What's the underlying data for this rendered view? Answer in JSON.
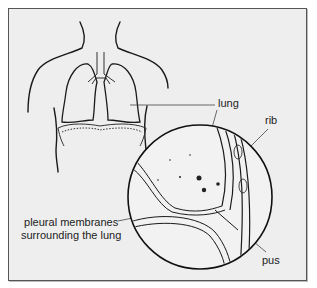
{
  "diagram": {
    "labels": {
      "lung": "lung",
      "rib": "rib",
      "pleural_line1": "pleural membranes",
      "pleural_line2": "surrounding the lung",
      "pus": "pus"
    },
    "colors": {
      "background": "#eeeeee",
      "frame": "#555555",
      "ink": "#1a1a1a",
      "text": "#222222"
    }
  }
}
